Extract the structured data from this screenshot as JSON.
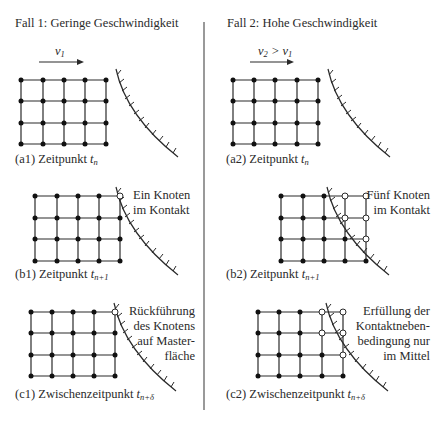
{
  "columns": [
    {
      "title": "Fall 1: Geringe Geschwindigkeit",
      "velocity_label": "v",
      "velocity_sub": "1",
      "velocity_rel": "",
      "panels": [
        {
          "caption_prefix": "(a1) Zeitpunkt ",
          "caption_var": "t",
          "caption_sub": "n",
          "annotation": []
        },
        {
          "caption_prefix": "(b1) Zeitpunkt ",
          "caption_var": "t",
          "caption_sub": "n+1",
          "annotation": [
            "Ein Knoten",
            "im Kontakt"
          ]
        },
        {
          "caption_prefix": "(c1) Zwischenzeitpunkt ",
          "caption_var": "t",
          "caption_sub": "n+δ",
          "annotation": [
            "Rückführung",
            "des Knotens",
            "auf Master-",
            "fläche"
          ]
        }
      ]
    },
    {
      "title": "Fall 2: Hohe Geschwindigkeit",
      "velocity_label": "v",
      "velocity_sub": "2",
      "velocity_rel": " > v",
      "velocity_rel_sub": "1",
      "panels": [
        {
          "caption_prefix": "(a2) Zeitpunkt ",
          "caption_var": "t",
          "caption_sub": "n",
          "annotation": []
        },
        {
          "caption_prefix": "(b2) Zeitpunkt ",
          "caption_var": "t",
          "caption_sub": "n+1",
          "annotation": [
            "Fünf Knoten",
            "im Kontakt"
          ]
        },
        {
          "caption_prefix": "(c2) Zwischenzeitpunkt ",
          "caption_var": "t",
          "caption_sub": "n+δ",
          "annotation": [
            "Erfüllung der",
            "Kontaktneben-",
            "bedingung nur",
            "im Mittel"
          ]
        }
      ]
    }
  ],
  "colors": {
    "line": "#2a2a2a",
    "node_filled": "#111111",
    "node_open": "#ffffff",
    "divider": "#555555"
  }
}
